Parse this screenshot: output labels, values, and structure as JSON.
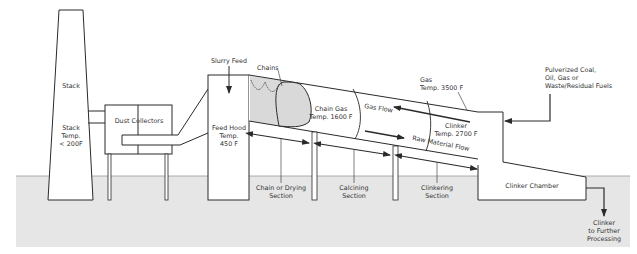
{
  "diagram": {
    "type": "process-flow",
    "colors": {
      "ground": "#e6e6e6",
      "line": "#2a2a2a",
      "chain_fill": "#d9d9d9",
      "background": "#ffffff"
    },
    "components": {
      "stack": {
        "label": "Stack",
        "temp_label_1": "Stack",
        "temp_label_2": "Temp.",
        "temp_label_3": "< 200F"
      },
      "dust_collectors": {
        "label": "Dust Collectors"
      },
      "slurry_feed": {
        "label": "Slurry Feed"
      },
      "feed_hood": {
        "label_1": "Feed Hood",
        "label_2": "Temp.",
        "label_3": "450 F"
      },
      "chains": {
        "label": "Chains"
      },
      "chain_gas": {
        "label_1": "Chain Gas",
        "label_2": "Temp. 1600 F"
      },
      "gas_flow": {
        "label": "Gas Flow"
      },
      "gas_temp": {
        "label_1": "Gas",
        "label_2": "Temp. 3500 F"
      },
      "clinker_temp": {
        "label_1": "Clinker",
        "label_2": "Temp. 2700 F"
      },
      "raw_material_flow": {
        "label": "Raw Material Flow"
      },
      "fuel_input": {
        "label_1": "Pulverized Coal,",
        "label_2": "Oil, Gas or",
        "label_3": "Waste/Residual Fuels"
      },
      "clinker_chamber": {
        "label": "Clinker Chamber"
      },
      "clinker_output": {
        "label_1": "Clinker",
        "label_2": "to Further",
        "label_3": "Processing"
      }
    },
    "sections": [
      {
        "label_1": "Chain or Drying",
        "label_2": "Section"
      },
      {
        "label_1": "Calcining",
        "label_2": "Section"
      },
      {
        "label_1": "Clinkering",
        "label_2": "Section"
      }
    ]
  }
}
